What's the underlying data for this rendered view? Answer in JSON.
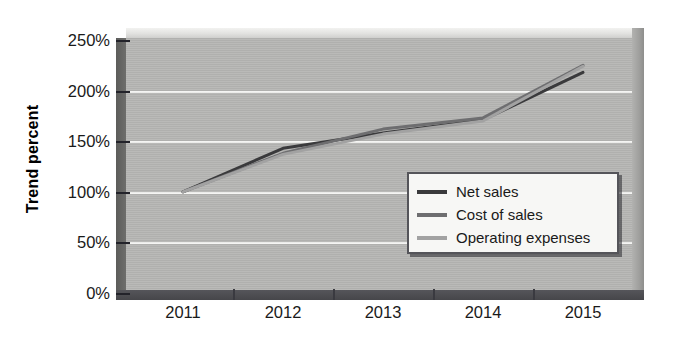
{
  "chart_data": {
    "type": "line",
    "title": "",
    "xlabel": "",
    "ylabel": "Trend percent",
    "categories": [
      "2011",
      "2012",
      "2013",
      "2014",
      "2015"
    ],
    "ylim": [
      0,
      250
    ],
    "ytick_values": [
      0,
      50,
      100,
      150,
      200,
      250
    ],
    "ytick_labels": [
      "0%",
      "50%",
      "100%",
      "150%",
      "200%",
      "250%"
    ],
    "grid": true,
    "legend_position": "bottom-right",
    "series": [
      {
        "name": "Net sales",
        "color": "#3a3a3c",
        "values": [
          100,
          143,
          158,
          171,
          218
        ]
      },
      {
        "name": "Cost of sales",
        "color": "#6e6e70",
        "values": [
          100,
          138,
          162,
          173,
          225
        ]
      },
      {
        "name": "Operating expenses",
        "color": "#a2a2a2",
        "values": [
          100,
          137,
          157,
          170,
          224
        ]
      }
    ]
  },
  "axes": {
    "y_title": "Trend percent"
  },
  "legend": {
    "entries": [
      {
        "label": "Net sales",
        "color": "#3a3a3c"
      },
      {
        "label": "Cost of sales",
        "color": "#6e6e70"
      },
      {
        "label": "Operating expenses",
        "color": "#a2a2a2"
      }
    ]
  },
  "colors": {
    "plot_background": "#b6b6b4",
    "gridline": "#f4f4f2",
    "axis_dark": "#46464a",
    "legend_background": "#f7f7f5"
  }
}
